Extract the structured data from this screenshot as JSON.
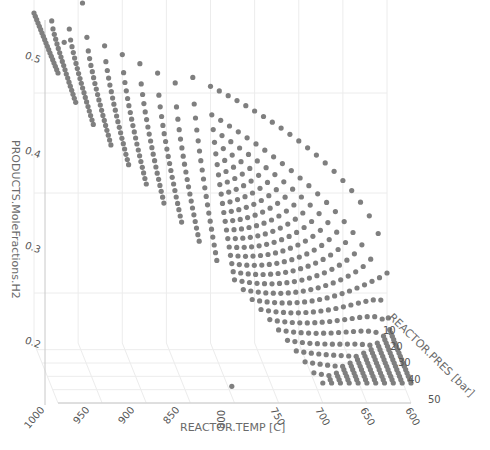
{
  "chart_data": {
    "type": "scatter3d",
    "title": "",
    "xlabel": "REACTOR.TEMP [C]",
    "ylabel": "REACTOR.PRES [bar]",
    "zlabel": "PRODUCTS.MoleFractions.H2",
    "x_ticks": [
      1000,
      950,
      900,
      850,
      800,
      750,
      700,
      650,
      600
    ],
    "y_ticks": [
      10,
      20,
      30,
      40,
      50
    ],
    "z_ticks": [
      0.2,
      0.3,
      0.4,
      0.5
    ],
    "xlim": [
      600,
      1000
    ],
    "ylim": [
      5,
      50
    ],
    "zlim": [
      0.15,
      0.52
    ],
    "marker_color": "#7f7f7f",
    "grid": true,
    "temperatures": [
      1000,
      980,
      960,
      940,
      920,
      900,
      880,
      860,
      840,
      820,
      800,
      790,
      780,
      770,
      760,
      750,
      740,
      730,
      720,
      710,
      700,
      690,
      680,
      670,
      660,
      650,
      640,
      630,
      620,
      610,
      600
    ],
    "pressures": [
      5,
      7.5,
      10,
      12.5,
      15,
      17.5,
      20,
      22.5,
      25,
      27.5,
      30,
      32.5,
      35,
      37.5,
      40,
      42.5,
      45,
      47.5,
      50
    ],
    "h2_model": {
      "description": "H2 mole fraction approx per (T,P): high (~0.48) at 1000C nearly pressure-independent, decreasing with lower T and higher P down to ~0.17 at 600C/50bar",
      "max": 0.48,
      "min": 0.17
    },
    "outliers": [
      {
        "temp": 965,
        "pres": 5,
        "h2": 0.5
      },
      {
        "temp": 945,
        "pres": 5,
        "h2": 0.49
      },
      {
        "temp": 970,
        "pres": 12,
        "h2": 0.46
      },
      {
        "temp": 800,
        "pres": 45,
        "h2": 0.16
      }
    ]
  },
  "axes": {
    "x_title": "REACTOR.TEMP [C]",
    "y_title": "REACTOR.PRES [bar]",
    "z_title": "PRODUCTS.MoleFractions.H2"
  }
}
